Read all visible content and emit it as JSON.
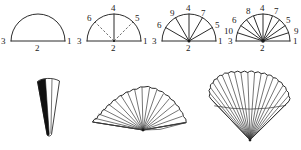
{
  "figure": {
    "background_color": "#ffffff",
    "ink_color": "#2b2b2b",
    "caption": "",
    "top_row": {
      "name": "semicircle-division-diagrams",
      "diagrams": [
        {
          "id": "diagram-1",
          "name": "semicircle-plain",
          "description": "semicircle with diameter, no radial divisions",
          "rib_count": 0,
          "has_dashed_ribs": false,
          "labels": [
            {
              "text": "3",
              "position": "left-end"
            },
            {
              "text": "2",
              "position": "bottom-center"
            },
            {
              "text": "1",
              "position": "right-end"
            }
          ]
        },
        {
          "id": "diagram-2",
          "name": "semicircle-three-divisions",
          "description": "semicircle with one solid vertical radius and two dashed radii",
          "rib_count": 3,
          "has_dashed_ribs": true,
          "labels": [
            {
              "text": "3",
              "position": "left-end"
            },
            {
              "text": "2",
              "position": "bottom-center"
            },
            {
              "text": "1",
              "position": "right-end"
            },
            {
              "text": "6",
              "position": "arc-upper-left"
            },
            {
              "text": "4",
              "position": "arc-top"
            },
            {
              "text": "5",
              "position": "arc-upper-right"
            }
          ]
        },
        {
          "id": "diagram-3",
          "name": "semicircle-five-divisions",
          "description": "semicircle with five solid radii",
          "rib_count": 5,
          "has_dashed_ribs": false,
          "labels": [
            {
              "text": "3",
              "position": "left-end"
            },
            {
              "text": "2",
              "position": "bottom-center"
            },
            {
              "text": "1",
              "position": "right-end"
            },
            {
              "text": "6",
              "position": "arc-left"
            },
            {
              "text": "9",
              "position": "arc-upper-left"
            },
            {
              "text": "4",
              "position": "arc-top"
            },
            {
              "text": "7",
              "position": "arc-upper-right"
            },
            {
              "text": "5",
              "position": "arc-right"
            }
          ]
        },
        {
          "id": "diagram-4",
          "name": "semicircle-nine-divisions",
          "description": "semicircle with nine solid radii",
          "rib_count": 9,
          "has_dashed_ribs": false,
          "labels": [
            {
              "text": "3",
              "position": "left-end"
            },
            {
              "text": "2",
              "position": "bottom-center"
            },
            {
              "text": "1",
              "position": "right-end"
            },
            {
              "text": "10",
              "position": "arc-far-left"
            },
            {
              "text": "6",
              "position": "arc-left"
            },
            {
              "text": "8",
              "position": "arc-upper-left"
            },
            {
              "text": "4",
              "position": "arc-top"
            },
            {
              "text": "7",
              "position": "arc-upper-right"
            },
            {
              "text": "5",
              "position": "arc-right"
            },
            {
              "text": "9",
              "position": "arc-far-right"
            }
          ]
        }
      ]
    },
    "bottom_row": {
      "name": "fan-illustrations",
      "items": [
        {
          "id": "fan-closed",
          "name": "closed-fan",
          "description": "narrow folded fan, wedge shape with dark shaded left blade",
          "open_state": "closed",
          "rib_count": 2
        },
        {
          "id": "fan-half-open",
          "name": "half-open-fan",
          "description": "partially opened fan spread to about a half circle with scalloped leaf edge",
          "open_state": "half-open",
          "rib_count": 19
        },
        {
          "id": "fan-fully-open",
          "name": "fully-open-fan",
          "description": "fully opened fan spread beyond a half circle with scalloped leaf edge and a banding line across the leaf",
          "open_state": "fully-open",
          "rib_count": 19
        }
      ]
    }
  }
}
